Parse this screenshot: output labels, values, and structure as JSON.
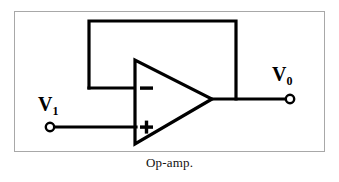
{
  "figure": {
    "caption": "Op-amp.",
    "border_color": "#a8a8a8",
    "wire_color": "#000000",
    "background": "#ffffff"
  },
  "labels": {
    "input": {
      "symbol": "V",
      "subscript": "1"
    },
    "output": {
      "symbol": "V",
      "subscript": "0"
    }
  },
  "component": {
    "type": "operational-amplifier",
    "inverting_input_symbol": "−",
    "noninverting_input_symbol": "+"
  },
  "terminals": [
    {
      "name": "input-terminal",
      "label": "V1"
    },
    {
      "name": "output-terminal",
      "label": "V0"
    }
  ]
}
